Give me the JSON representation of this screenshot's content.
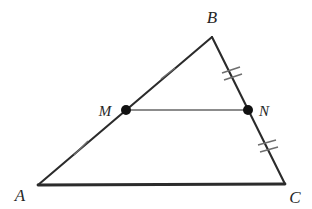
{
  "figure": {
    "background_color": "#ffffff",
    "edge_color": "#2b2b2b",
    "midsegment_color": "#8c8c8c",
    "tick_color": "#6e6e6e",
    "point_color": "#111111",
    "label_color": "#262626",
    "width": 312,
    "height": 209
  },
  "vertices": {
    "A": {
      "label": "A",
      "x": 38,
      "y": 185,
      "label_x": 20,
      "label_y": 201
    },
    "B": {
      "label": "B",
      "x": 212,
      "y": 37,
      "label_x": 212,
      "label_y": 23
    },
    "C": {
      "label": "C",
      "x": 285,
      "y": 184,
      "label_x": 295,
      "label_y": 203
    }
  },
  "points": {
    "M": {
      "label": "M",
      "x": 126,
      "y": 110,
      "label_x": 104,
      "label_y": 116,
      "on_segment": "AB",
      "role": "midpoint"
    },
    "N": {
      "label": "N",
      "x": 248,
      "y": 110,
      "label_x": 262,
      "label_y": 116,
      "on_segment": "BC",
      "role": "midpoint"
    }
  },
  "segments": [
    {
      "name": "AB",
      "from": "A",
      "to": "B",
      "style": "solid",
      "weight": "normal"
    },
    {
      "name": "BC",
      "from": "B",
      "to": "C",
      "style": "solid",
      "weight": "normal"
    },
    {
      "name": "AC",
      "from": "A",
      "to": "C",
      "style": "solid",
      "weight": "bold"
    },
    {
      "name": "MN",
      "from": "M",
      "to": "N",
      "style": "solid",
      "weight": "light"
    }
  ],
  "tick_marks": [
    {
      "segment": "AM",
      "count": 1,
      "x": 81,
      "y": 148
    },
    {
      "segment": "MB",
      "count": 1,
      "x": 168,
      "y": 74
    },
    {
      "segment": "BN",
      "count": 2,
      "x": 231,
      "y": 74
    },
    {
      "segment": "NC",
      "count": 2,
      "x": 267,
      "y": 147
    }
  ]
}
